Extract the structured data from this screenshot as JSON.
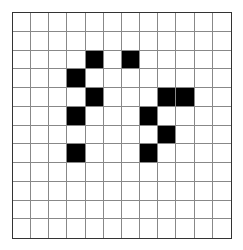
{
  "grid": {
    "rows": 12,
    "cols": 12,
    "fill_color": "#000000",
    "empty_color": "#ffffff",
    "line_color": "#888888",
    "filled_cells": [
      [
        2,
        4
      ],
      [
        2,
        6
      ],
      [
        3,
        3
      ],
      [
        4,
        4
      ],
      [
        4,
        8
      ],
      [
        4,
        9
      ],
      [
        5,
        3
      ],
      [
        5,
        7
      ],
      [
        6,
        8
      ],
      [
        7,
        3
      ],
      [
        7,
        7
      ]
    ]
  }
}
